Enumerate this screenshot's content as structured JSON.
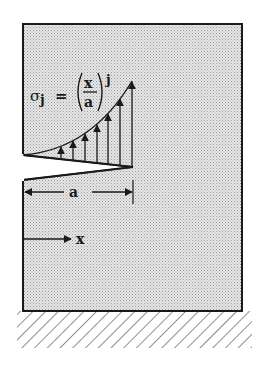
{
  "figure": {
    "equation": {
      "lhs_symbol": "σ",
      "lhs_subscript": "j",
      "equals": "=",
      "numerator": "x",
      "denominator": "a",
      "exponent": "j"
    },
    "dimension_label": "a",
    "axis_label": "x",
    "colors": {
      "body_fill": "#d9d9d9",
      "line": "#1a1a1a",
      "background": "#ffffff"
    },
    "stress_arrows_count": 7
  }
}
